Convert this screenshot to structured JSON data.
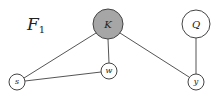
{
  "graph": {
    "label": "F",
    "label_subscript": "1",
    "nodes": [
      {
        "id": "K",
        "label": "K",
        "cx": 108,
        "cy": 24,
        "r": 15,
        "fill": "#a6a6a6",
        "observed": true
      },
      {
        "id": "Q",
        "label": "Q",
        "cx": 196,
        "cy": 24,
        "r": 14,
        "fill": "#ffffff",
        "observed": false
      },
      {
        "id": "w",
        "label": "w",
        "cx": 109,
        "cy": 71,
        "r": 8,
        "fill": "#ffffff",
        "observed": false
      },
      {
        "id": "s",
        "label": "s",
        "cx": 17,
        "cy": 82,
        "r": 8,
        "fill": "#ffffff",
        "observed": false
      },
      {
        "id": "y",
        "label": "y",
        "cx": 196,
        "cy": 82,
        "r": 8,
        "fill": "#ffffff",
        "observed": false
      }
    ],
    "edges": [
      {
        "from": "K",
        "to": "s"
      },
      {
        "from": "K",
        "to": "w"
      },
      {
        "from": "K",
        "to": "y"
      },
      {
        "from": "s",
        "to": "w"
      },
      {
        "from": "Q",
        "to": "y"
      }
    ]
  }
}
